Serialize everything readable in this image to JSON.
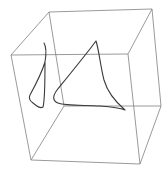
{
  "figure": {
    "type": "3d-wireframe-cube-with-curves",
    "colors": {
      "background": "#ffffff",
      "cube_edges": "#808080",
      "curves": "#3a3a3a"
    },
    "cube": {
      "vertices": {
        "top_back_left": [
          49,
          12
        ],
        "top_back_right": [
          152,
          9
        ],
        "top_front_left": [
          11,
          55
        ],
        "top_front_right": [
          128,
          54
        ],
        "bottom_back_left": [
          64,
          106
        ],
        "bottom_back_right": [
          161,
          106
        ],
        "bottom_front_left": [
          31,
          160
        ],
        "bottom_front_right": [
          140,
          164
        ]
      }
    },
    "curves": [
      {
        "name": "left-loop-curve",
        "path": "M44,43 C47,48 46,56 45,62 C42,72 36,84 30,95 C28,99 30,101 33,103 C37,106 40,109 43,107 C45,100 45,80 45,62"
      },
      {
        "name": "right-cusp-curve",
        "path": "M96,41 C88,52 70,74 57,90 C52,97 53,101 58,103 C66,106 84,105 100,106 C112,107 120,108 125,110 C118,104 108,94 104,80 C100,64 99,50 96,41"
      }
    ]
  }
}
